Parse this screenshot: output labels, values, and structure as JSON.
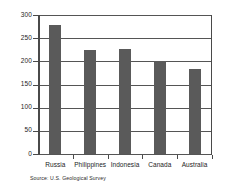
{
  "chart_data": {
    "type": "bar",
    "title": "",
    "xlabel": "",
    "ylabel": "",
    "categories": [
      "Russia",
      "Philippines",
      "Indonesia",
      "Canada",
      "Australia"
    ],
    "values": [
      278,
      225,
      226,
      200,
      183
    ],
    "ylim": [
      0,
      300
    ],
    "yticks": [
      0,
      50,
      100,
      150,
      200,
      250,
      300
    ],
    "ytick_labels": [
      "0",
      "50",
      "100",
      "150",
      "200",
      "250",
      "300"
    ],
    "grid": "horizontal",
    "legend": "none",
    "bar_color": "#5a5a5a",
    "gridline_color": "#555555",
    "axis_color": "#4a4a4a",
    "background_color": "#ffffff",
    "annotations": [
      {
        "name": "source-note",
        "text": "Source: U.S. Geological Survey"
      }
    ]
  }
}
